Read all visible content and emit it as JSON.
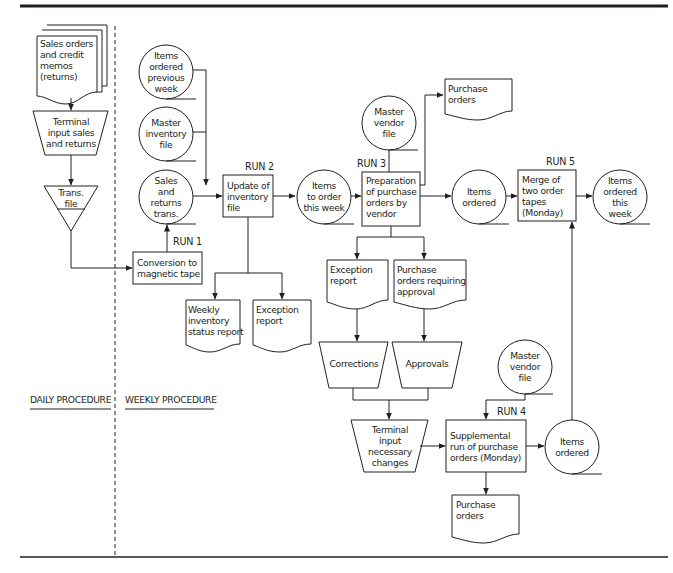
{
  "diagram": {
    "colors": {
      "stroke": "#231f20",
      "background": "#ffffff"
    },
    "sections": {
      "daily": "DAILY PROCEDURE",
      "weekly": "WEEKLY PROCEDURE"
    },
    "runs": {
      "run1": "RUN 1",
      "run2": "RUN 2",
      "run3": "RUN 3",
      "run4": "RUN 4",
      "run5": "RUN 5"
    },
    "nodes": {
      "sales_orders_doc": "Sales orders\nand credit\nmemos\n(returns)",
      "terminal_input_sales": "Terminal\ninput sales\nand returns",
      "trans_file": "Trans.\nfile",
      "items_ordered_prev_week": "Items\nordered\nprevious\nweek",
      "master_inventory_file": "Master\ninventory\nfile",
      "sales_returns_trans": "Sales\nand\nreturns\ntrans.",
      "conversion_to_tape": "Conversion to\nmagnetic tape",
      "update_inventory": "Update of\ninventory\nfile",
      "weekly_inventory_report": "Weekly\ninventory\nstatus report",
      "exception_report_1": "Exception\nreport",
      "items_to_order": "Items\nto order\nthis week",
      "master_vendor_file_1": "Master\nvendor\nfile",
      "purchase_orders_1": "Purchase\norders",
      "preparation_of_po": "Preparation\nof purchase\norders by\nvendor",
      "items_ordered_1": "Items\nordered",
      "merge_order_tapes": "Merge of\ntwo order\ntapes\n(Monday)",
      "items_ordered_this_week": "Items\nordered\nthis\nweek",
      "exception_report_2": "Exception\nreport",
      "po_requiring_approval": "Purchase\norders requiring\napproval",
      "corrections": "Corrections",
      "approvals": "Approvals",
      "terminal_input_changes": "Terminal\ninput\nnecessary\nchanges",
      "master_vendor_file_2": "Master\nvendor\nfile",
      "supplemental_run": "Supplemental\nrun of purchase\norders (Monday)",
      "items_ordered_2": "Items\nordered",
      "purchase_orders_2": "Purchase\norders"
    }
  }
}
